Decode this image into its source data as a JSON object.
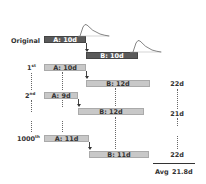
{
  "rows": {
    "original": {
      "label": "Original",
      "a": "A: 10d",
      "b": "B: 10d"
    },
    "first": {
      "label_num": "1",
      "label_sup": "st",
      "a": "A: 10d",
      "b": "B: 12d",
      "total": "22d"
    },
    "second": {
      "label_num": "2",
      "label_sup": "nd",
      "a": "A: 9d",
      "b": "B: 12d",
      "total": "21d"
    },
    "thousandth": {
      "label_num": "1000",
      "label_sup": "th",
      "a": "A: 11d",
      "b": "B: 11d",
      "total": "22d"
    }
  },
  "summary": {
    "avg_label": "Avg",
    "avg_value": "21.8d"
  },
  "colors": {
    "original_bar": "#5a5a5a",
    "simulated_bar": "#c8c8c8"
  }
}
